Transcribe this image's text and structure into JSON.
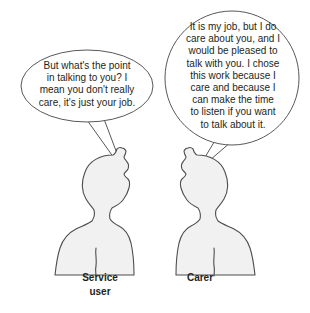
{
  "illustration": {
    "title": "Service user and carer conversation",
    "background_color": "#ffffff",
    "line_color": "#4d4d4f",
    "figure_fill_color": "#f1f1f2",
    "text_color": "#231f20"
  },
  "left": {
    "speech": "But what's the point\nin talking to you? I\nmean you don't really\ncare, it's just your job.",
    "label": "Service\nuser",
    "bubble_type": "ellipse"
  },
  "right": {
    "speech": "It is my job, but I do\ncare about you, and I\nwould be pleased to\ntalk with you. I chose\nthis work because I\ncare and because I\ncan make the time\nto listen if you want\nto talk about it.",
    "label": "Carer",
    "bubble_type": "circle"
  }
}
